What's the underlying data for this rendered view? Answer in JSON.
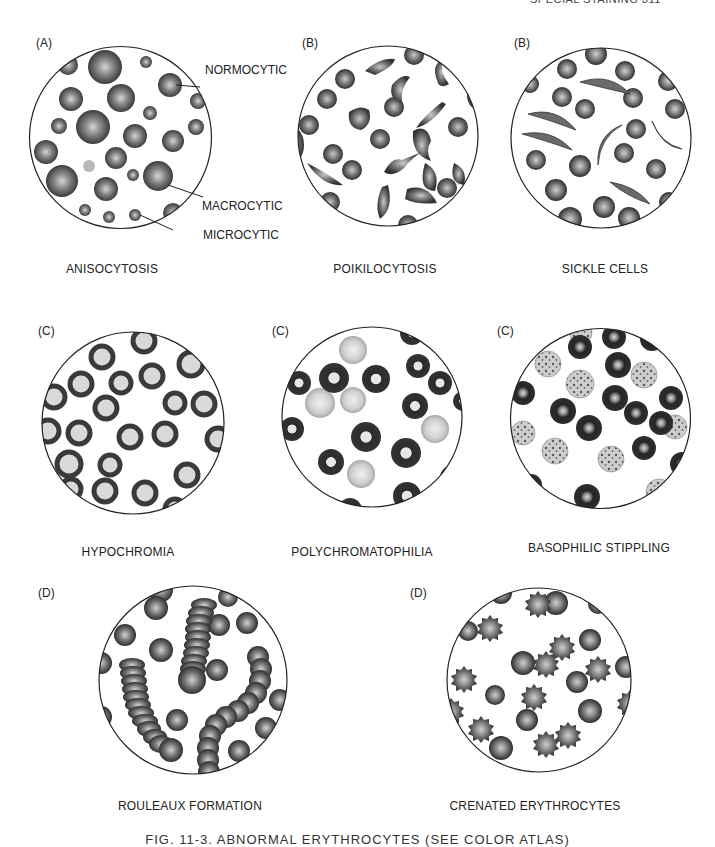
{
  "page": {
    "running_head": "SPECIAL STAINING    311"
  },
  "panels": [
    {
      "id": "anisocytosis",
      "letter": "(A)",
      "title": "ANISOCYTOSIS",
      "callouts": [
        "NORMOCYTIC",
        "MACROCYTIC",
        "MICROCYTIC"
      ]
    },
    {
      "id": "poikilocytosis",
      "letter": "(B)",
      "title": "POIKILOCYTOSIS"
    },
    {
      "id": "sickle-cells",
      "letter": "(B)",
      "title": "SICKLE CELLS"
    },
    {
      "id": "hypochromia",
      "letter": "(C)",
      "title": "HYPOCHROMIA"
    },
    {
      "id": "polychromatophilia",
      "letter": "(C)",
      "title": "POLYCHROMATOPHILIA"
    },
    {
      "id": "basophilic-stippling",
      "letter": "(C)",
      "title": "BASOPHILIC STIPPLING"
    },
    {
      "id": "rouleaux-formation",
      "letter": "(D)",
      "title": "ROULEAUX FORMATION"
    },
    {
      "id": "crenated-erythrocytes",
      "letter": "(D)",
      "title": "CRENATED ERYTHROCYTES"
    }
  ],
  "caption": "FIG. 11-3.  ABNORMAL ERYTHROCYTES (SEE COLOR ATLAS)",
  "colors": {
    "cell_dark": "#3a3a3a",
    "cell_mid": "#6e6e6e",
    "cell_pale": "#bdbdbd",
    "center_light": "#d8d8d8",
    "outline": "#222222"
  }
}
